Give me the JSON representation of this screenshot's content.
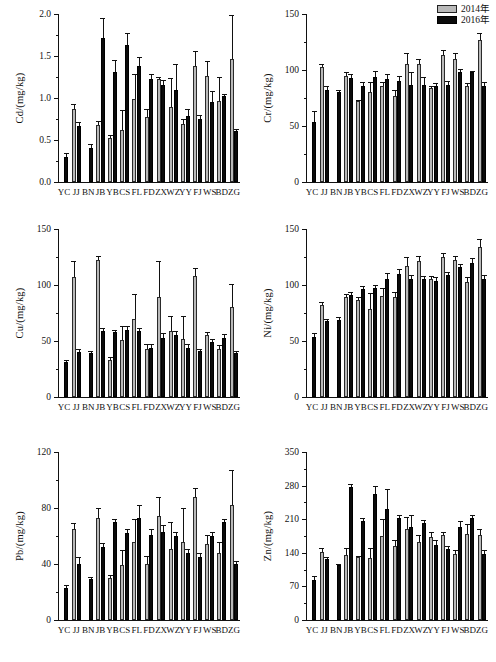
{
  "legend": {
    "position": "top-right",
    "entries": [
      {
        "label": "2014年",
        "color": "#b9b9b9",
        "key": "y2014"
      },
      {
        "label": "2016年",
        "color": "#0b0b0b",
        "key": "y2016"
      }
    ]
  },
  "categories": [
    "YC",
    "JJ",
    "BN",
    "JB",
    "YB",
    "CS",
    "FL",
    "FD",
    "ZX",
    "WZ",
    "YY",
    "FJ",
    "WS",
    "BD",
    "ZG"
  ],
  "chart_data": [
    {
      "type": "bar",
      "title": "",
      "ylabel": "Cd/(mg/kg)",
      "xlabel": "",
      "ylim": [
        0,
        2.0
      ],
      "yticks": [
        0.0,
        0.5,
        1.0,
        1.5,
        2.0
      ],
      "ytick_labels": [
        "0.0",
        "0.5",
        "1.0",
        "1.5",
        "2.0"
      ],
      "grid": false,
      "categories": [
        "YC",
        "JJ",
        "BN",
        "JB",
        "YB",
        "CS",
        "FL",
        "FD",
        "ZX",
        "WZ",
        "YY",
        "FJ",
        "WS",
        "BD",
        "ZG"
      ],
      "series": [
        {
          "name": "2014年",
          "values": [
            null,
            0.87,
            null,
            0.68,
            0.52,
            0.62,
            0.99,
            0.77,
            1.23,
            0.89,
            0.69,
            1.38,
            1.26,
            0.97,
            1.47
          ],
          "errors": [
            null,
            0.06,
            null,
            0.05,
            0.04,
            0.24,
            0.3,
            0.1,
            0.02,
            0.35,
            0.06,
            0.18,
            0.18,
            0.28,
            0.52
          ]
        },
        {
          "name": "2016年",
          "values": [
            0.3,
            0.67,
            0.41,
            1.72,
            1.31,
            1.63,
            1.38,
            1.23,
            1.15,
            1.09,
            0.78,
            0.75,
            0.95,
            1.02,
            0.61
          ],
          "errors": [
            0.04,
            0.05,
            0.04,
            0.23,
            0.14,
            0.14,
            0.11,
            0.06,
            0.06,
            0.31,
            0.09,
            0.05,
            0.13,
            0.03,
            0.02
          ]
        }
      ]
    },
    {
      "type": "bar",
      "title": "",
      "ylabel": "Cr/(mg/kg)",
      "xlabel": "",
      "ylim": [
        0,
        150
      ],
      "yticks": [
        0,
        50,
        100,
        150
      ],
      "ytick_labels": [
        "0",
        "50",
        "100",
        "150"
      ],
      "grid": false,
      "categories": [
        "YC",
        "JJ",
        "BN",
        "JB",
        "YB",
        "CS",
        "FL",
        "FD",
        "ZX",
        "WZ",
        "YY",
        "FJ",
        "WS",
        "BD",
        "ZG"
      ],
      "series": [
        {
          "name": "2014年",
          "values": [
            null,
            103,
            null,
            95,
            72,
            80,
            86,
            77,
            105,
            105,
            84,
            113,
            110,
            86,
            127
          ],
          "errors": [
            null,
            2,
            null,
            3,
            1,
            9,
            3,
            5,
            10,
            5,
            2,
            5,
            5,
            2,
            6
          ]
        },
        {
          "name": "2016年",
          "values": [
            54,
            82,
            80,
            93,
            86,
            94,
            92,
            90,
            87,
            87,
            86,
            87,
            98,
            98,
            86
          ],
          "errors": [
            9,
            4,
            2,
            3,
            3,
            5,
            4,
            5,
            11,
            7,
            2,
            3,
            3,
            1,
            3
          ]
        }
      ]
    },
    {
      "type": "bar",
      "title": "",
      "ylabel": "Cu/(mg/kg)",
      "xlabel": "",
      "ylim": [
        0,
        150
      ],
      "yticks": [
        0,
        50,
        100,
        150
      ],
      "ytick_labels": [
        "0",
        "50",
        "100",
        "150"
      ],
      "grid": false,
      "categories": [
        "YC",
        "JJ",
        "BN",
        "JB",
        "YB",
        "CS",
        "FL",
        "FD",
        "ZX",
        "WZ",
        "YY",
        "FJ",
        "WS",
        "BD",
        "ZG"
      ],
      "series": [
        {
          "name": "2014年",
          "values": [
            null,
            107,
            null,
            122,
            33,
            51,
            70,
            43,
            89,
            59,
            52,
            108,
            55,
            43,
            80
          ],
          "errors": [
            null,
            14,
            null,
            4,
            3,
            12,
            22,
            4,
            32,
            13,
            20,
            7,
            3,
            3,
            21
          ]
        },
        {
          "name": "2016年",
          "values": [
            31,
            40,
            39,
            59,
            58,
            60,
            59,
            44,
            53,
            55,
            44,
            41,
            49,
            53,
            39
          ],
          "errors": [
            2,
            3,
            2,
            3,
            2,
            3,
            3,
            3,
            4,
            4,
            3,
            2,
            3,
            3,
            2
          ]
        }
      ]
    },
    {
      "type": "bar",
      "title": "",
      "ylabel": "Ni/(mg/kg)",
      "xlabel": "",
      "ylim": [
        0,
        150
      ],
      "yticks": [
        0,
        50,
        100,
        150
      ],
      "ytick_labels": [
        "0",
        "50",
        "100",
        "150"
      ],
      "grid": false,
      "categories": [
        "YC",
        "JJ",
        "BN",
        "JB",
        "YB",
        "CS",
        "FL",
        "FD",
        "ZX",
        "WZ",
        "YY",
        "FJ",
        "WS",
        "BD",
        "ZG"
      ],
      "series": [
        {
          "name": "2014年",
          "values": [
            null,
            82,
            null,
            89,
            87,
            79,
            90,
            89,
            117,
            121,
            105,
            125,
            122,
            103,
            134
          ],
          "errors": [
            null,
            3,
            null,
            3,
            2,
            14,
            7,
            5,
            8,
            5,
            3,
            4,
            4,
            4,
            7
          ]
        },
        {
          "name": "2016年",
          "values": [
            54,
            68,
            69,
            91,
            96,
            97,
            105,
            110,
            105,
            105,
            104,
            109,
            116,
            120,
            105
          ],
          "errors": [
            3,
            2,
            2,
            3,
            3,
            3,
            6,
            4,
            4,
            3,
            3,
            3,
            3,
            4,
            4
          ]
        }
      ]
    },
    {
      "type": "bar",
      "title": "",
      "ylabel": "Pb/(mg/kg)",
      "xlabel": "",
      "ylim": [
        0,
        120
      ],
      "yticks": [
        0,
        40,
        80,
        120
      ],
      "ytick_labels": [
        "0",
        "40",
        "80",
        "120"
      ],
      "grid": false,
      "categories": [
        "YC",
        "JJ",
        "BN",
        "JB",
        "YB",
        "CS",
        "FL",
        "FD",
        "ZX",
        "WZ",
        "YY",
        "FJ",
        "WS",
        "BD",
        "ZG"
      ],
      "series": [
        {
          "name": "2014年",
          "values": [
            null,
            65,
            null,
            73,
            30,
            39,
            56,
            40,
            74,
            51,
            56,
            88,
            54,
            48,
            82
          ],
          "errors": [
            null,
            4,
            null,
            7,
            2,
            11,
            16,
            6,
            14,
            19,
            24,
            6,
            7,
            8,
            25
          ]
        },
        {
          "name": "2016年",
          "values": [
            23,
            40,
            29,
            52,
            70,
            62,
            73,
            61,
            63,
            60,
            48,
            45,
            60,
            70,
            40
          ],
          "errors": [
            2,
            5,
            2,
            3,
            2,
            3,
            9,
            4,
            5,
            3,
            3,
            3,
            3,
            2,
            2
          ]
        }
      ]
    },
    {
      "type": "bar",
      "title": "",
      "ylabel": "Zn/(mg/kg)",
      "xlabel": "",
      "ylim": [
        0,
        350
      ],
      "yticks": [
        0,
        70,
        140,
        210,
        280,
        350
      ],
      "ytick_labels": [
        "0",
        "70",
        "140",
        "210",
        "280",
        "350"
      ],
      "grid": false,
      "categories": [
        "YC",
        "JJ",
        "BN",
        "JB",
        "YB",
        "CS",
        "FL",
        "FD",
        "ZX",
        "WZ",
        "YY",
        "FJ",
        "WS",
        "BD",
        "ZG"
      ],
      "series": [
        {
          "name": "2014年",
          "values": [
            null,
            141,
            null,
            135,
            131,
            129,
            175,
            155,
            190,
            163,
            173,
            178,
            138,
            180,
            178
          ],
          "errors": [
            null,
            9,
            null,
            14,
            3,
            20,
            36,
            12,
            24,
            14,
            10,
            6,
            8,
            20,
            12
          ]
        },
        {
          "name": "2016年",
          "values": [
            84,
            128,
            114,
            278,
            207,
            263,
            232,
            212,
            194,
            202,
            156,
            148,
            194,
            212,
            138
          ],
          "errors": [
            7,
            4,
            3,
            5,
            6,
            16,
            41,
            6,
            25,
            7,
            11,
            6,
            13,
            6,
            7
          ]
        }
      ]
    }
  ]
}
